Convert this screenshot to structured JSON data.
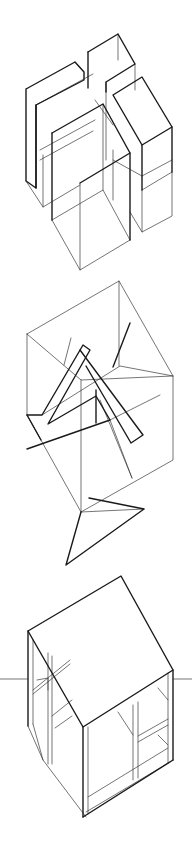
{
  "figure": {
    "background": "#ffffff",
    "ink": "#1a1a1a",
    "sketches": [
      {
        "name": "stacked-boxes-cluster",
        "lines_thick": [
          "26,89 75,62 84,72 84,80 36,105 36,188 26,181 26,89",
          "36,105 36,188",
          "88,52 118,34 135,64 106,82 106,92",
          "88,52 88,88",
          "113,95 142,77 172,127 142,145 113,95",
          "142,145 142,190",
          "172,127 172,172",
          "52,133 103,104 130,153 130,240",
          "52,133 52,220",
          "80,183 130,153"
        ],
        "lines_thin": [
          "36,105 93,74",
          "75,62 84,72",
          "106,82 106,160",
          "118,34 118,60",
          "135,64 135,90",
          "26,181 43,207 80,185",
          "43,155 43,207",
          "52,220 80,270 130,240",
          "80,183 80,270",
          "52,220 103,190 130,240",
          "103,104 103,190",
          "113,150 113,200",
          "113,160 142,176",
          "142,176 172,160",
          "142,190 172,172",
          "142,190 142,232 172,216 172,172",
          "130,212 142,232",
          "95,100 113,125",
          "40,150 95,120",
          "40,160 93,131"
        ]
      },
      {
        "name": "cube-with-folded-plane",
        "lines_thick": [
          "27,415 42,415 83,345 90,350 48,424 96,396 110,420 27,449",
          "27,415 41,440",
          "80,350 143,435 131,443 86,366",
          "96,390 96,423",
          "130,323 113,367",
          "89,498 144,509 66,565 81,512"
        ],
        "lines_thin": [
          "27,334 119,281 173,376 173,460 81,512 27,415 27,334",
          "27,334 81,380 173,376",
          "81,380 81,512",
          "119,281 119,366",
          "81,512 144,509",
          "42,415 120,366 173,376",
          "110,420 160,395",
          "71,338 64,365",
          "100,400 132,478",
          "110,420 132,478"
        ]
      },
      {
        "name": "open-frame-pavilion",
        "lines_thick": [
          "28,631 121,576 173,670 83,727 28,631",
          "28,631 28,726",
          "83,727 83,817",
          "173,670 173,760",
          "83,817 173,760"
        ],
        "lines_thin": [
          "33,640 33,724",
          "88,727 88,814",
          "168,673 168,763",
          "86,817 43,760 28,726",
          "86,812 170,762",
          "33,724 43,760",
          "88,797 168,748",
          "133,705 133,780",
          "138,702 138,778",
          "138,736 168,719",
          "138,742 168,725",
          "48,653 48,764",
          "52,656 52,764",
          "33,690 70,660",
          "33,694 70,664",
          "37,680 48,678 48,690",
          "55,728 72,716",
          "52,716 72,700",
          "118,712 133,735",
          "158,688 168,700",
          "158,735 168,745"
        ],
        "ground_line": [
          "0,679 28,679",
          "173,679 192,679"
        ]
      }
    ]
  }
}
